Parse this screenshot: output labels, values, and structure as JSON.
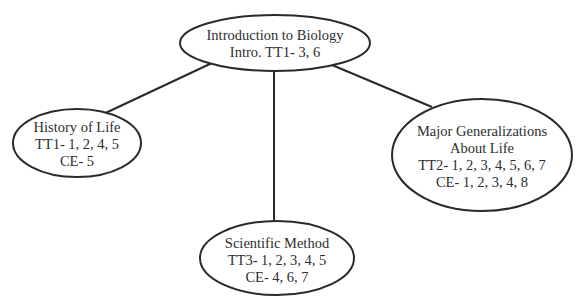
{
  "diagram": {
    "type": "concept-map",
    "colors": {
      "stroke": "#2a2a2a",
      "text": "#2e2e2e",
      "background": "#ffffff"
    },
    "nodes": [
      {
        "id": "intro",
        "lines": [
          "Introduction to Biology",
          "Intro. TT1- 3, 6"
        ]
      },
      {
        "id": "history",
        "lines": [
          "History of Life",
          "TT1- 1, 2, 4, 5",
          "CE- 5"
        ]
      },
      {
        "id": "major",
        "lines": [
          "Major Generalizations",
          "About Life",
          "TT2- 1, 2, 3, 4, 5, 6, 7",
          "CE- 1, 2, 3, 4, 8"
        ]
      },
      {
        "id": "scientific",
        "lines": [
          "Scientific Method",
          "TT3- 1, 2, 3, 4, 5",
          "CE- 4, 6, 7"
        ]
      }
    ],
    "edges": [
      {
        "from": "intro",
        "to": "history"
      },
      {
        "from": "intro",
        "to": "scientific"
      },
      {
        "from": "intro",
        "to": "major"
      }
    ]
  }
}
